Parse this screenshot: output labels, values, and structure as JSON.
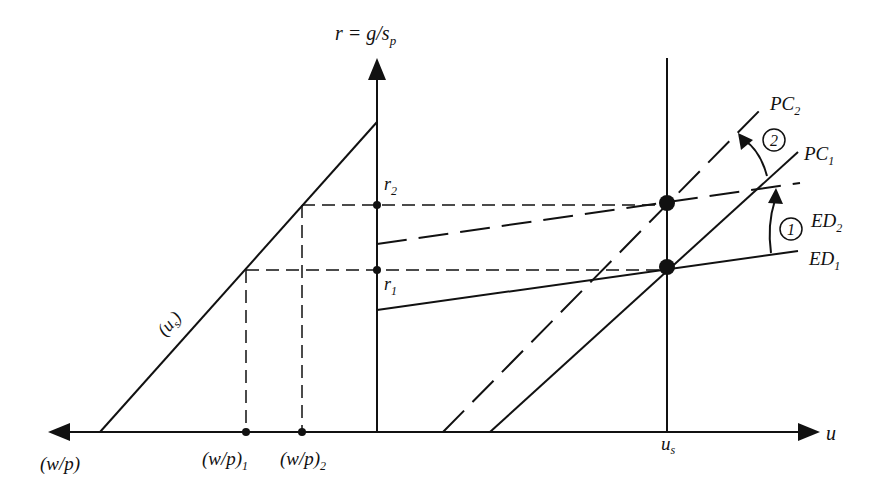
{
  "diagram": {
    "type": "economics-diagram",
    "axes": {
      "vertical_label": "r = g/s",
      "vertical_label_sub": "p",
      "horizontal_right_label": "u",
      "horizontal_left_label": "(w/p)"
    },
    "ticks": {
      "r2": {
        "main": "r",
        "sub": "2"
      },
      "r1": {
        "main": "r",
        "sub": "1"
      },
      "wp1": {
        "main": "(w/p)",
        "sub": "1"
      },
      "wp2": {
        "main": "(w/p)",
        "sub": "2"
      },
      "us": {
        "main": "u",
        "sub": "s"
      }
    },
    "curves": {
      "us_line": {
        "main": "(u",
        "sub": "s",
        "close": ")"
      },
      "pc2": {
        "main": "PC",
        "sub": "2"
      },
      "pc1": {
        "main": "PC",
        "sub": "1"
      },
      "ed2": {
        "main": "ED",
        "sub": "2"
      },
      "ed1": {
        "main": "ED",
        "sub": "1"
      }
    },
    "shift_markers": {
      "one": "1",
      "two": "2"
    }
  }
}
